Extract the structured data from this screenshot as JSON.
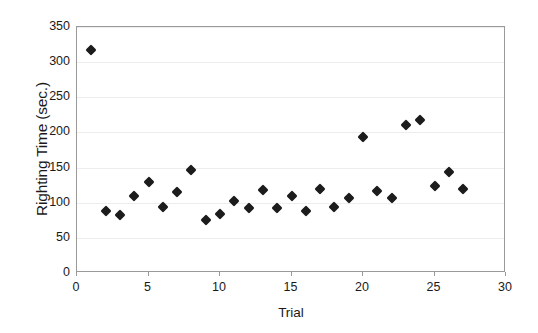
{
  "chart_data": {
    "type": "scatter",
    "title": "",
    "xlabel": "Trial",
    "ylabel": "Righting Time (sec.)",
    "xlim": [
      0,
      30
    ],
    "ylim": [
      0,
      350
    ],
    "xticks": [
      0,
      5,
      10,
      15,
      20,
      25,
      30
    ],
    "yticks": [
      0,
      50,
      100,
      150,
      200,
      250,
      300,
      350
    ],
    "grid": true,
    "grid_axis": "y",
    "legend": false,
    "marker": "diamond",
    "marker_color": "#1c1c1c",
    "x": [
      1,
      2,
      3,
      4,
      5,
      6,
      7,
      8,
      9,
      10,
      11,
      12,
      13,
      14,
      15,
      16,
      17,
      18,
      19,
      20,
      21,
      22,
      23,
      24,
      25,
      26,
      27
    ],
    "y": [
      317,
      88,
      82,
      109,
      130,
      94,
      115,
      147,
      75,
      84,
      102,
      93,
      118,
      92,
      110,
      88,
      119,
      94,
      106,
      193,
      117,
      107,
      211,
      218,
      124,
      144,
      119
    ],
    "points": [
      {
        "trial": 1,
        "righting_time": 317
      },
      {
        "trial": 2,
        "righting_time": 88
      },
      {
        "trial": 3,
        "righting_time": 82
      },
      {
        "trial": 4,
        "righting_time": 109
      },
      {
        "trial": 5,
        "righting_time": 130
      },
      {
        "trial": 6,
        "righting_time": 94
      },
      {
        "trial": 7,
        "righting_time": 115
      },
      {
        "trial": 8,
        "righting_time": 147
      },
      {
        "trial": 9,
        "righting_time": 75
      },
      {
        "trial": 10,
        "righting_time": 84
      },
      {
        "trial": 11,
        "righting_time": 102
      },
      {
        "trial": 12,
        "righting_time": 93
      },
      {
        "trial": 13,
        "righting_time": 118
      },
      {
        "trial": 14,
        "righting_time": 92
      },
      {
        "trial": 15,
        "righting_time": 110
      },
      {
        "trial": 16,
        "righting_time": 88
      },
      {
        "trial": 17,
        "righting_time": 119
      },
      {
        "trial": 18,
        "righting_time": 94
      },
      {
        "trial": 19,
        "righting_time": 106
      },
      {
        "trial": 20,
        "righting_time": 193
      },
      {
        "trial": 21,
        "righting_time": 117
      },
      {
        "trial": 22,
        "righting_time": 107
      },
      {
        "trial": 23,
        "righting_time": 211
      },
      {
        "trial": 24,
        "righting_time": 218
      },
      {
        "trial": 25,
        "righting_time": 124
      },
      {
        "trial": 26,
        "righting_time": 144
      },
      {
        "trial": 27,
        "righting_time": 119
      }
    ]
  }
}
